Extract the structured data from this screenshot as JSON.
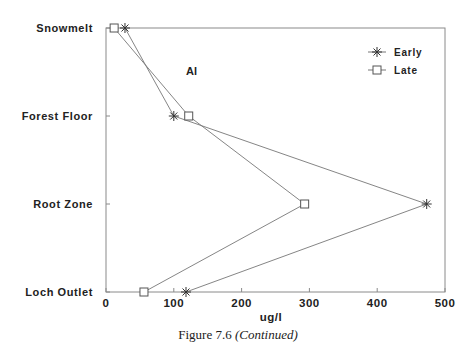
{
  "chart_data": {
    "type": "line",
    "orientation": "horizontal-categories-on-y",
    "title": "",
    "annotation": "Al",
    "xlabel": "ug/l",
    "ylabel": "",
    "xlim": [
      0,
      500
    ],
    "xticks": [
      0,
      100,
      200,
      300,
      400,
      500
    ],
    "categories": [
      "Snowmelt",
      "Forest Floor",
      "Root Zone",
      "Loch Outlet"
    ],
    "series": [
      {
        "name": "Early",
        "marker": "asterisk",
        "values": [
          28,
          100,
          473,
          118
        ]
      },
      {
        "name": "Late",
        "marker": "square",
        "values": [
          12,
          122,
          293,
          56
        ]
      }
    ],
    "legend_position": "upper right",
    "grid": false
  },
  "caption": {
    "prefix": "Figure 7.6",
    "suffix": "(Continued)"
  }
}
